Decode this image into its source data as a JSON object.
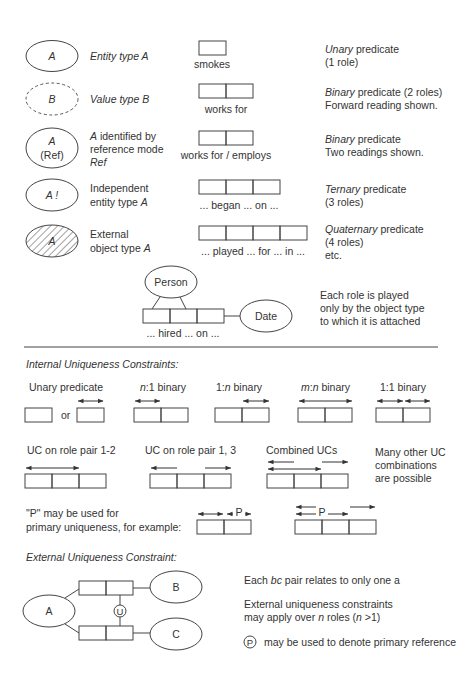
{
  "object_types": [
    {
      "symbol": "A",
      "kind": "entity",
      "desc": [
        "Entity type A"
      ],
      "desc_italic": [
        true
      ]
    },
    {
      "symbol": "B",
      "kind": "value",
      "desc": [
        "Value type B"
      ],
      "desc_italic": [
        true
      ]
    },
    {
      "symbol": "A",
      "symbol2": "(Ref)",
      "kind": "ref",
      "desc": [
        "A identified by",
        "reference mode",
        "Ref"
      ]
    },
    {
      "symbol": "A !",
      "kind": "independent",
      "desc": [
        "Independent",
        "entity type A"
      ]
    },
    {
      "symbol": "A",
      "kind": "external",
      "desc": [
        "External",
        "object type A"
      ]
    }
  ],
  "predicates": [
    {
      "reading": "smokes",
      "roles": 1,
      "desc": [
        "Unary predicate",
        "(1 role)"
      ],
      "italic_word": "Unary"
    },
    {
      "reading": "works for",
      "roles": 2,
      "desc": [
        "Binary predicate (2 roles)",
        "Forward reading shown."
      ],
      "italic_word": "Binary"
    },
    {
      "reading": "works for / employs",
      "roles": 2,
      "desc": [
        "Binary predicate",
        "Two readings shown."
      ],
      "italic_word": "Binary"
    },
    {
      "reading": "... began ... on ...",
      "roles": 3,
      "desc": [
        "Ternary predicate",
        "(3 roles)"
      ],
      "italic_word": "Ternary"
    },
    {
      "reading": "... played ... for ... in ...",
      "roles": 4,
      "desc": [
        "Quaternary predicate",
        "(4 roles)",
        "etc."
      ],
      "italic_word": "Quaternary"
    }
  ],
  "role_example": {
    "top_object": "Person",
    "side_object": "Date",
    "reading": "... hired ... on ...",
    "desc": [
      "Each role is played",
      "only by the object type",
      "to which it is attached"
    ]
  },
  "internal_uc": {
    "title": "Internal Uniqueness Constraints:",
    "row1": [
      {
        "label": "Unary predicate"
      },
      {
        "label": "n:1 binary"
      },
      {
        "label": "1:n binary"
      },
      {
        "label": "m:n binary"
      },
      {
        "label": "1:1 binary"
      }
    ],
    "or_label": "or",
    "row2": [
      {
        "label": "UC on role pair 1-2"
      },
      {
        "label": "UC on role pair 1, 3"
      },
      {
        "label": "Combined UCs"
      }
    ],
    "row2_note": [
      "Many other UC",
      "combinations",
      "are possible"
    ],
    "primary_note": [
      "\"P\" may be used for",
      "primary uniqueness, for example:"
    ],
    "p_label": "P"
  },
  "external_uc": {
    "title": "External Uniqueness Constraint:",
    "objects": {
      "a": "A",
      "b": "B",
      "c": "C"
    },
    "u_label": "U",
    "notes": [
      "Each bc pair relates to only one a",
      "External uniqueness constraints",
      "may apply over n roles (n >1)",
      "may be used to denote primary reference"
    ],
    "p_label": "P"
  }
}
